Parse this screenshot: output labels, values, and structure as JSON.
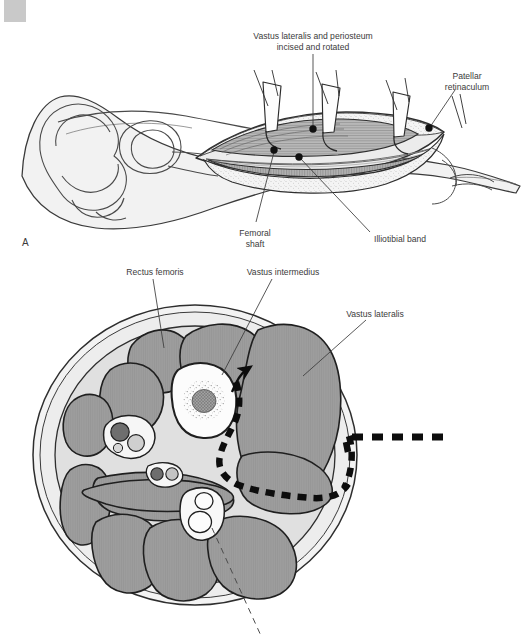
{
  "header": {
    "running_head": "SECTION IV  •  PEDIATRIC KNEE"
  },
  "figure": {
    "panels": [
      {
        "letter": "A"
      }
    ],
    "panel_a": {
      "labels": [
        {
          "name": "label-vastus-lateralis-periosteum",
          "text": "Vastus lateralis and periosteum\nincised and rotated",
          "x": 232,
          "y": 31,
          "w": 162
        },
        {
          "name": "label-patellar-retinaculum",
          "text": "Patellar\nretinaculum",
          "x": 428,
          "y": 71,
          "w": 78
        },
        {
          "name": "label-femoral-shaft",
          "text": "Femoral\nshaft",
          "x": 228,
          "y": 228,
          "w": 54
        },
        {
          "name": "label-illiotibial-band",
          "text": "Illiotibial band",
          "x": 374,
          "y": 234,
          "w": 80
        }
      ]
    },
    "panel_b": {
      "labels": [
        {
          "name": "label-rectus-femoris",
          "text": "Rectus femoris",
          "x": 113,
          "y": 267,
          "w": 84
        },
        {
          "name": "label-vastus-intermedius",
          "text": "Vastus intermedius",
          "x": 231,
          "y": 267,
          "w": 104
        },
        {
          "name": "label-vastus-lateralis",
          "text": "Vastus lateralis",
          "x": 332,
          "y": 309,
          "w": 86
        }
      ]
    }
  },
  "colors": {
    "ink": "#2b2b2b",
    "label_ink": "#3b3b3b",
    "muscle_fill": "#9a9a9a",
    "muscle_fill_light": "#a8a8a8",
    "fascia_fill": "#e3e3e3",
    "skin_fill": "#f2f2f2",
    "bone_fill": "#fbfbfb",
    "marrow_fill": "#9d9d9d",
    "vessel_dark": "#6e6e6e",
    "vessel_light": "#cfcfcf",
    "retractor_fill": "#fdfdfd",
    "incision_dash": "#0d0d0d",
    "header_tint": "#ededed",
    "corner_block": "#c9c9c9"
  }
}
